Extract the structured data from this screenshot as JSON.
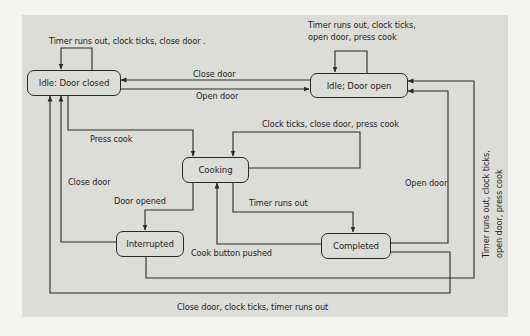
{
  "diagram": {
    "type": "state-machine",
    "states": [
      {
        "id": "idle_closed",
        "label": "Idle: Door closed"
      },
      {
        "id": "idle_open",
        "label": "Idle; Door open"
      },
      {
        "id": "cooking",
        "label": "Cooking"
      },
      {
        "id": "interrupted",
        "label": "Interrupted"
      },
      {
        "id": "completed",
        "label": "Completed"
      }
    ],
    "transitions": [
      {
        "from": "idle_closed",
        "to": "idle_closed",
        "label": "Timer runs out, clock ticks, close door ."
      },
      {
        "from": "idle_open",
        "to": "idle_open",
        "label_line1": "Timer runs out, clock ticks,",
        "label_line2": "open door, press cook"
      },
      {
        "from": "idle_open",
        "to": "idle_closed",
        "label": "Close door"
      },
      {
        "from": "idle_closed",
        "to": "idle_open",
        "label": "Open door"
      },
      {
        "from": "idle_closed",
        "to": "cooking",
        "label": "Press cook"
      },
      {
        "from": "cooking",
        "to": "cooking",
        "label": "Clock ticks, close door, press cook"
      },
      {
        "from": "interrupted",
        "to": "idle_closed",
        "label": "Close door"
      },
      {
        "from": "cooking",
        "to": "interrupted",
        "label": "Door opened"
      },
      {
        "from": "cooking",
        "to": "completed",
        "label": "Timer runs out"
      },
      {
        "from": "completed",
        "to": "cooking",
        "label": "Cook button pushed"
      },
      {
        "from": "completed",
        "to": "idle_open",
        "label": "Open door"
      },
      {
        "from": "interrupted",
        "to": "idle_open",
        "label_line1": "Timer runs out, clock ticks,",
        "label_line2": "open door, press cook"
      },
      {
        "from": "completed",
        "to": "idle_closed",
        "label": "Close door, clock ticks, timer runs out"
      }
    ],
    "colors": {
      "line": "#2a2a2a",
      "background": "#dcdcd8",
      "page": "#f4f4f2"
    }
  }
}
